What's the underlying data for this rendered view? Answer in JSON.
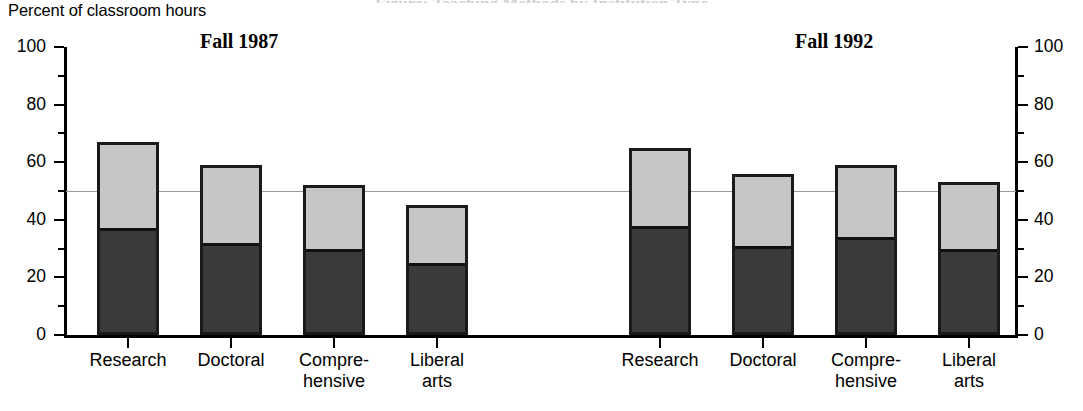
{
  "cut_off_title": "Figure: Teaching Methods by Institution Type",
  "axis_caption": "Percent of classroom hours",
  "panels": [
    {
      "id": "fall-1987",
      "title": "Fall 1987"
    },
    {
      "id": "fall-1992",
      "title": "Fall 1992"
    }
  ],
  "y_axis": {
    "ticks": [
      "0",
      "20",
      "40",
      "60",
      "80",
      "100"
    ],
    "min": 0,
    "max": 100,
    "minor_step": 10,
    "reference_line": 50
  },
  "colors": {
    "lower_segment": "#3a3a3a",
    "upper_segment": "#c6c6c6",
    "outline": "#1a1a1a",
    "reference_line": "#9a9a9a"
  },
  "chart_data": {
    "type": "bar",
    "title": "",
    "subtitle": "",
    "ylabel": "Percent of classroom hours",
    "xlabel": "",
    "ylim": [
      0,
      100
    ],
    "grid": false,
    "legend": "none",
    "stacked": true,
    "panels": [
      {
        "name": "Fall 1987",
        "categories": [
          "Research",
          "Compre-\nhensive",
          "Doctoral",
          "Liberal\narts"
        ],
        "categories_ordered": [
          "Research",
          "Doctoral",
          "Compre-\nhensive",
          "Liberal\narts"
        ],
        "series": [
          {
            "name": "lower",
            "values": [
              37,
              32,
              30,
              25
            ]
          },
          {
            "name": "upper",
            "values": [
              30,
              27,
              22,
              20
            ]
          }
        ],
        "totals": [
          67,
          59,
          52,
          45
        ]
      },
      {
        "name": "Fall 1992",
        "categories_ordered": [
          "Research",
          "Doctoral",
          "Compre-\nhensive",
          "Liberal\narts"
        ],
        "series": [
          {
            "name": "lower",
            "values": [
              38,
              31,
              34,
              30
            ]
          },
          {
            "name": "upper",
            "values": [
              27,
              25,
              25,
              23
            ]
          }
        ],
        "totals": [
          65,
          56,
          59,
          53
        ]
      }
    ]
  },
  "x_labels": {
    "research": "Research",
    "doctoral": "Doctoral",
    "comprehensive": "Compre-\nhensive",
    "liberal_arts": "Liberal\narts"
  }
}
